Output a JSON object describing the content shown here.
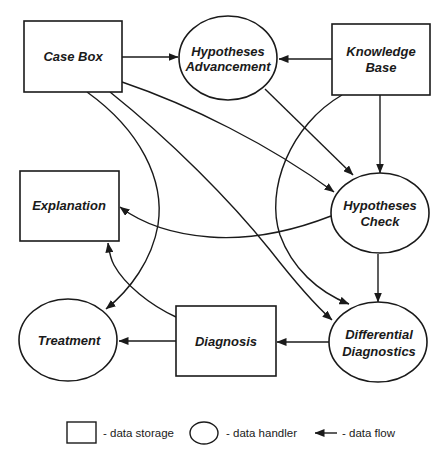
{
  "diagram": {
    "nodes": {
      "case_box": {
        "label_lines": [
          "Case Box"
        ],
        "type": "data storage"
      },
      "hypotheses_advancement": {
        "label_lines": [
          "Hypotheses",
          "Advancement"
        ],
        "type": "data handler"
      },
      "knowledge_base": {
        "label_lines": [
          "Knowledge",
          "Base"
        ],
        "type": "data storage"
      },
      "explanation": {
        "label_lines": [
          "Explanation"
        ],
        "type": "data storage"
      },
      "hypotheses_check": {
        "label_lines": [
          "Hypotheses",
          "Check"
        ],
        "type": "data handler"
      },
      "treatment": {
        "label_lines": [
          "Treatment"
        ],
        "type": "data handler"
      },
      "diagnosis": {
        "label_lines": [
          "Diagnosis"
        ],
        "type": "data storage"
      },
      "differential_diagnostics": {
        "label_lines": [
          "Differential",
          "Diagnostics"
        ],
        "type": "data handler"
      }
    },
    "edges": [
      {
        "from": "Case Box",
        "to": "Hypotheses Advancement"
      },
      {
        "from": "Knowledge Base",
        "to": "Hypotheses Advancement"
      },
      {
        "from": "Case Box",
        "to": "Hypotheses Check"
      },
      {
        "from": "Hypotheses Advancement",
        "to": "Hypotheses Check"
      },
      {
        "from": "Knowledge Base",
        "to": "Hypotheses Check"
      },
      {
        "from": "Knowledge Base",
        "to": "Differential Diagnostics"
      },
      {
        "from": "Case Box",
        "to": "Differential Diagnostics"
      },
      {
        "from": "Case Box",
        "to": "Treatment"
      },
      {
        "from": "Hypotheses Check",
        "to": "Explanation"
      },
      {
        "from": "Hypotheses Check",
        "to": "Differential Diagnostics"
      },
      {
        "from": "Diagnosis",
        "to": "Explanation"
      },
      {
        "from": "Diagnosis",
        "to": "Treatment"
      },
      {
        "from": "Differential Diagnostics",
        "to": "Diagnosis"
      }
    ]
  },
  "legend": {
    "storage": "- data storage",
    "handler": "- data handler",
    "flow": "- data flow"
  }
}
